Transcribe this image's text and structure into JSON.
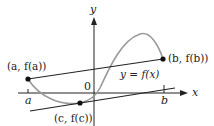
{
  "figure": {
    "axes": {
      "x_label": "x",
      "y_label": "y",
      "origin_label": "0"
    },
    "curve": {
      "label": "y = f(x)",
      "color": "#9a9a9a"
    },
    "points": [
      {
        "id": "a",
        "label": "(a, f(a))"
      },
      {
        "id": "b",
        "label": "(b, f(b))"
      },
      {
        "id": "c",
        "label": "(c, f(c))"
      }
    ],
    "ticks": [
      {
        "id": "a",
        "label": "a"
      },
      {
        "id": "b",
        "label": "b"
      }
    ],
    "lines": {
      "secant": "secant line through (a, f(a)) and (b, f(b))",
      "tangent": "tangent line at (c, f(c)) parallel to secant"
    },
    "colors": {
      "ink": "#222222",
      "curve": "#9a9a9a",
      "background": "#ffffff"
    }
  }
}
